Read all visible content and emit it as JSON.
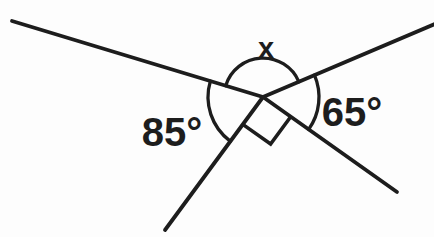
{
  "diagram": {
    "background_color": "#fdfdfd",
    "line_color": "#1d1d1d",
    "line_width": 3.8,
    "arc_width": 3.3,
    "marker_width": 3.6,
    "vertex": {
      "x": 263,
      "y": 97
    },
    "rays": [
      {
        "name": "ray-upper-left",
        "x2": 12,
        "y2": 21
      },
      {
        "name": "ray-upper-right",
        "x2": 435,
        "y2": 24
      },
      {
        "name": "ray-lower-left",
        "x2": 165,
        "y2": 230
      },
      {
        "name": "ray-lower-right",
        "x2": 397,
        "y2": 192
      }
    ],
    "angle_arcs": [
      {
        "name": "angle-x-arc",
        "radius": 39,
        "from_ray": 1,
        "to_ray": 0,
        "sweep": 0
      },
      {
        "name": "angle-85-arc",
        "radius": 55,
        "from_ray": 0,
        "to_ray": 2,
        "sweep": 0
      },
      {
        "name": "angle-65-arc",
        "radius": 56,
        "from_ray": 1,
        "to_ray": 3,
        "sweep": 1
      }
    ],
    "right_angle_marker": {
      "name": "right-angle-marker",
      "represents": "right angle",
      "ray_a": 2,
      "ray_b": 3,
      "size": 34
    },
    "angle_labels": [
      {
        "name": "angle-x-label",
        "text": "x"
      },
      {
        "name": "angle-85-label",
        "text": "85°"
      },
      {
        "name": "angle-65-label",
        "text": "65°"
      }
    ]
  }
}
